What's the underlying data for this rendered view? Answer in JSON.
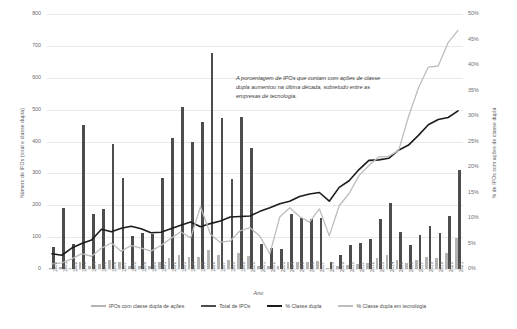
{
  "chart_data": {
    "type": "bar",
    "title": "",
    "xlabel": "Ano",
    "ylabel": "Número de IPOs (total e classe dupla)",
    "y2label": "% de IPOs com ações de classe dupla",
    "ylim": [
      0,
      800
    ],
    "y2lim": [
      0,
      0.5
    ],
    "grid": true,
    "legend_position": "bottom",
    "annotation": "A porcentagem de IPOs que contam com ações de classe dupla aumentou na última década, sobretudo entre as empresas de tecnologia.",
    "yticks": [
      "0",
      "100",
      "200",
      "300",
      "400",
      "500",
      "600",
      "700",
      "800"
    ],
    "y2ticks": [
      "0%",
      "5%",
      "10%",
      "15%",
      "20%",
      "25%",
      "30%",
      "35%",
      "40%",
      "45%",
      "50%"
    ],
    "categories": [
      "1980",
      "1981",
      "1982",
      "1983",
      "1984",
      "1985",
      "1986",
      "1987",
      "1988",
      "1989",
      "1990",
      "1991",
      "1992",
      "1993",
      "1994",
      "1995",
      "1996",
      "1997",
      "1998",
      "1999",
      "2000",
      "2001",
      "2002",
      "2003",
      "2004",
      "2005",
      "2006",
      "2007",
      "2008",
      "2009",
      "2010",
      "2011",
      "2012",
      "2013",
      "2014",
      "2015",
      "2016",
      "2017",
      "2018",
      "2019",
      "2020",
      "2021"
    ],
    "series": [
      {
        "name": "Total de IPOs",
        "axis": "left",
        "kind": "bar",
        "color": "#4d4d4d",
        "values": [
          70,
          192,
          77,
          451,
          172,
          187,
          393,
          285,
          105,
          113,
          110,
          286,
          412,
          509,
          397,
          460,
          677,
          474,
          281,
          476,
          381,
          79,
          66,
          63,
          173,
          159,
          157,
          159,
          21,
          43,
          75,
          81,
          93,
          158,
          206,
          115,
          74,
          107,
          134,
          112,
          165,
          311
        ]
      },
      {
        "name": "IPOs com classe dupla de ações",
        "axis": "left",
        "kind": "bar",
        "color": "#b4b4b4",
        "values": [
          2,
          5,
          3,
          23,
          10,
          15,
          29,
          23,
          9,
          9,
          8,
          21,
          33,
          44,
          37,
          39,
          61,
          45,
          29,
          49,
          40,
          9,
          8,
          8,
          23,
          23,
          23,
          24,
          4,
          8,
          13,
          16,
          20,
          34,
          45,
          27,
          18,
          28,
          38,
          33,
          49,
          96
        ]
      },
      {
        "name": "% Classe dupla",
        "axis": "right",
        "kind": "line",
        "color": "#1c1c1c",
        "values": [
          0.03,
          0.027,
          0.041,
          0.05,
          0.057,
          0.078,
          0.073,
          0.08,
          0.084,
          0.079,
          0.071,
          0.072,
          0.079,
          0.086,
          0.092,
          0.083,
          0.089,
          0.094,
          0.102,
          0.103,
          0.104,
          0.113,
          0.12,
          0.128,
          0.133,
          0.142,
          0.147,
          0.15,
          0.133,
          0.16,
          0.173,
          0.195,
          0.213,
          0.214,
          0.217,
          0.233,
          0.243,
          0.262,
          0.283,
          0.293,
          0.297,
          0.31
        ]
      },
      {
        "name": "% Classe dupla em tecnologia",
        "axis": "right",
        "kind": "line",
        "color": "#bdbdbd",
        "values": [
          0.01,
          0.012,
          0.02,
          0.03,
          0.025,
          0.041,
          0.051,
          0.035,
          0.046,
          0.041,
          0.035,
          0.046,
          0.06,
          0.073,
          0.061,
          0.122,
          0.068,
          0.052,
          0.055,
          0.075,
          0.081,
          0.064,
          0.03,
          0.102,
          0.12,
          0.103,
          0.092,
          0.118,
          0.065,
          0.124,
          0.148,
          0.183,
          0.203,
          0.22,
          0.221,
          0.232,
          0.299,
          0.355,
          0.396,
          0.398,
          0.444,
          0.468
        ]
      }
    ]
  },
  "legend": {
    "items": [
      {
        "label": "IPOs com classe dupla de ações",
        "color": "#b4b4b4",
        "kind": "bar"
      },
      {
        "label": "Total de IPOs",
        "color": "#4d4d4d",
        "kind": "bar"
      },
      {
        "label": "% Classe dupla",
        "color": "#1c1c1c",
        "kind": "line"
      },
      {
        "label": "% Classe dupla em tecnologia",
        "color": "#bdbdbd",
        "kind": "line"
      }
    ]
  }
}
